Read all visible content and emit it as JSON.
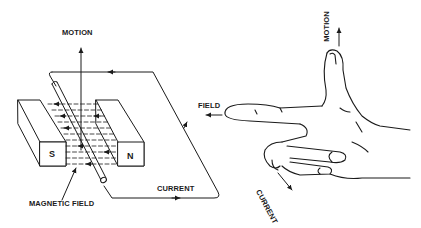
{
  "diagram": {
    "title": "",
    "colors": {
      "ink": "#1a1a1a",
      "background": "#ffffff"
    },
    "left_figure": {
      "labels": {
        "motion": "MOTION",
        "current": "CURRENT",
        "magnetic_field": "MAGNETIC FIELD",
        "south_pole": "S",
        "north_pole": "N"
      }
    },
    "right_figure": {
      "labels": {
        "field": "FIELD",
        "motion": "MOTION",
        "current": "CURRENT"
      }
    }
  }
}
